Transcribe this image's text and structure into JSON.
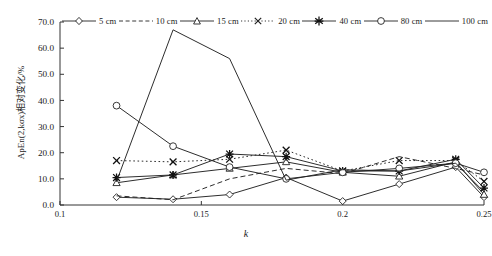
{
  "chart_data": {
    "type": "line",
    "title": "",
    "xlabel": "k",
    "ylabel": "ApEn(2,kσx)相对变化/%",
    "xlim": [
      0.1,
      0.25
    ],
    "ylim": [
      0.0,
      70.0
    ],
    "grid": false,
    "legend_position": "top",
    "x": [
      0.12,
      0.14,
      0.16,
      0.18,
      0.2,
      0.22,
      0.24,
      0.25
    ],
    "xticks": [
      "0.1",
      "0.15",
      "0.2",
      "0.25"
    ],
    "xtick_values": [
      0.1,
      0.15,
      0.2,
      0.25
    ],
    "yticks": [
      "0.0",
      "10.0",
      "20.0",
      "30.0",
      "40.0",
      "50.0",
      "60.0",
      "70.0"
    ],
    "ytick_values": [
      0,
      10,
      20,
      30,
      40,
      50,
      60,
      70
    ],
    "series": [
      {
        "name": "5 cm",
        "marker": "diamond",
        "dash": "none",
        "values": [
          3.0,
          2.2,
          4.0,
          10.5,
          1.5,
          8.0,
          14.5,
          3.0
        ]
      },
      {
        "name": "10 cm",
        "marker": "none",
        "dash": "dash",
        "values": [
          3.5,
          2.0,
          10.0,
          14.0,
          12.0,
          18.5,
          14.0,
          11.5
        ]
      },
      {
        "name": "15 cm",
        "marker": "triangle",
        "dash": "none",
        "values": [
          8.5,
          11.5,
          14.0,
          16.5,
          12.5,
          11.0,
          16.5,
          4.0
        ]
      },
      {
        "name": "20 cm",
        "marker": "cross",
        "dash": "dashdot",
        "values": [
          17.0,
          16.5,
          17.5,
          21.0,
          13.0,
          17.0,
          17.0,
          9.0
        ]
      },
      {
        "name": "40 cm",
        "marker": "star",
        "dash": "none",
        "values": [
          10.5,
          11.5,
          19.5,
          18.5,
          13.0,
          13.0,
          17.5,
          6.5
        ]
      },
      {
        "name": "80 cm",
        "marker": "circle",
        "dash": "none",
        "values": [
          38.0,
          22.5,
          14.5,
          10.0,
          12.5,
          14.0,
          16.0,
          12.5
        ]
      },
      {
        "name": "100 cm",
        "marker": "none",
        "dash": "none",
        "values": [
          9.0,
          67.0,
          56.0,
          9.5,
          13.5,
          13.0,
          16.0,
          5.0
        ]
      }
    ]
  }
}
